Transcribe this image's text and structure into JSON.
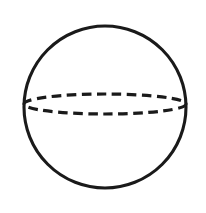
{
  "figure": {
    "background_color": "#ffffff",
    "stroke_color": "#1a1a1a",
    "canvas": {
      "width": 206,
      "height": 213
    },
    "shapes": {
      "outline": {
        "name": "sphere-outline-circle",
        "type": "circle",
        "style": "solid",
        "cx": 105,
        "cy": 107,
        "r": 81,
        "stroke_width": 3.1,
        "stroke_color": "#1a1a1a",
        "fill": "none"
      },
      "equator": {
        "name": "equator-ellipse",
        "type": "ellipse",
        "style": "dashed",
        "cx": 105,
        "cy": 104,
        "rx": 81,
        "ry": 10,
        "stroke_width": 3.2,
        "stroke_color": "#1a1a1a",
        "fill": "none",
        "dash_length": 9.5,
        "gap_length": 5.5
      }
    },
    "labels": []
  }
}
